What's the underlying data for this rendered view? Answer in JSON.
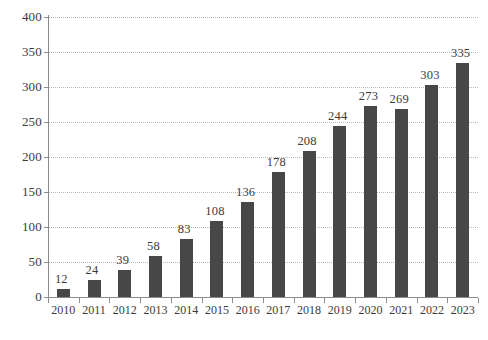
{
  "chart_data": {
    "type": "bar",
    "title": "",
    "subtitle": "",
    "xlabel": "",
    "ylabel": "",
    "categories": [
      "2010",
      "2011",
      "2012",
      "2013",
      "2014",
      "2015",
      "2016",
      "2017",
      "2018",
      "2019",
      "2020",
      "2021",
      "2022",
      "2023"
    ],
    "values": [
      12,
      24,
      39,
      58,
      83,
      108,
      136,
      178,
      208,
      244,
      273,
      269,
      303,
      335
    ],
    "ylim": [
      0,
      400
    ],
    "ytick_step": 50,
    "yticks": [
      "0",
      "50",
      "100",
      "150",
      "200",
      "250",
      "300",
      "350",
      "400"
    ],
    "grid": true,
    "grid_style": "dotted-horizontal",
    "legend": "none",
    "show_value_labels": true,
    "bar_color": "#474747",
    "grid_color": "#b9b9b9",
    "axis_color": "#8c8c8c",
    "text_color": "#3b3b3b",
    "background": "#ffffff"
  },
  "caption": {
    "cropped_text": ""
  }
}
